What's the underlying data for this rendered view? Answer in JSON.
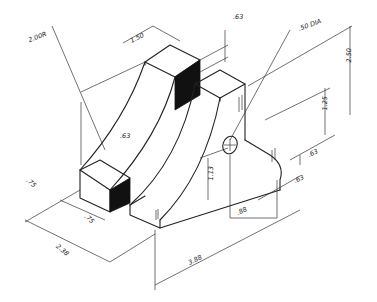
{
  "drawing": {
    "type": "isometric mechanical part",
    "ink_color": "#222222",
    "background": "#ffffff"
  },
  "dimensions": {
    "radius": "2.00R",
    "top_width": "1.50",
    "top_depth": ".63",
    "hole": ".50 DIA",
    "overall_height": "2.50",
    "hole_height": "1.25",
    "small_step": ".63",
    "inner_step": ".63",
    "left_front": ".75",
    "left_gap": ".75",
    "overall_depth": "2.38",
    "base_height": "1.13",
    "hole_offset": ".88",
    "right_offset": ".63",
    "overall_length": "3.88"
  }
}
